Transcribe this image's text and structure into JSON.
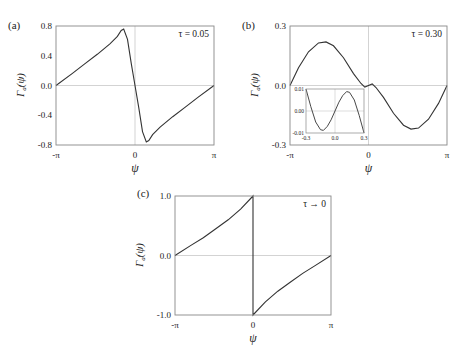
{
  "chart_data": [
    {
      "panel": "(a)",
      "type": "line",
      "annotation": "τ = 0.05",
      "xlabel": "ψ",
      "ylabel": "Γa(ψ)",
      "xlim": [
        -3.1416,
        3.1416
      ],
      "ylim": [
        -0.8,
        0.8
      ],
      "xticks": [
        "-π",
        "0",
        "π"
      ],
      "yticks": [
        "0.8",
        "0.4",
        "0.0",
        "-0.4",
        "-0.8"
      ],
      "grid": "zero lines only",
      "x": [
        -3.1416,
        -2.5,
        -2.0,
        -1.5,
        -1.0,
        -0.7,
        -0.55,
        -0.45,
        -0.3,
        -0.15,
        0.0,
        0.15,
        0.3,
        0.45,
        0.55,
        0.7,
        1.0,
        1.5,
        2.0,
        2.5,
        3.1416
      ],
      "values": [
        0.0,
        0.16,
        0.29,
        0.42,
        0.56,
        0.66,
        0.74,
        0.76,
        0.62,
        0.3,
        0.0,
        -0.3,
        -0.62,
        -0.76,
        -0.74,
        -0.66,
        -0.56,
        -0.42,
        -0.29,
        -0.16,
        0.0
      ]
    },
    {
      "panel": "(b)",
      "type": "line",
      "annotation": "τ = 0.30",
      "xlabel": "ψ",
      "ylabel": "Γa(ψ)",
      "xlim": [
        -3.1416,
        3.1416
      ],
      "ylim": [
        -0.3,
        0.3
      ],
      "xticks": [
        "-π",
        "0",
        "π"
      ],
      "yticks": [
        "0.3",
        "0.0",
        "-0.3"
      ],
      "grid": "zero lines only",
      "x": [
        -3.1416,
        -2.8,
        -2.4,
        -2.0,
        -1.7,
        -1.4,
        -1.0,
        -0.6,
        -0.3,
        -0.15,
        0.0,
        0.15,
        0.3,
        0.6,
        1.0,
        1.4,
        1.7,
        2.0,
        2.4,
        2.8,
        3.1416
      ],
      "values": [
        0.0,
        0.09,
        0.17,
        0.215,
        0.22,
        0.2,
        0.14,
        0.06,
        0.01,
        -0.008,
        0.0,
        0.008,
        -0.01,
        -0.06,
        -0.14,
        -0.2,
        -0.22,
        -0.215,
        -0.17,
        -0.09,
        0.0
      ],
      "inset": {
        "xlim": [
          -0.3,
          0.3
        ],
        "ylim": [
          -0.01,
          0.01
        ],
        "xticks": [
          "-0.3",
          "0.0",
          "0.3"
        ],
        "yticks": [
          "0.01",
          "0.00",
          "-0.01"
        ],
        "x": [
          -0.3,
          -0.25,
          -0.2,
          -0.15,
          -0.12,
          -0.08,
          -0.04,
          0.0,
          0.04,
          0.08,
          0.12,
          0.15,
          0.2,
          0.25,
          0.3
        ],
        "values": [
          0.01,
          0.002,
          -0.005,
          -0.0085,
          -0.0088,
          -0.007,
          -0.004,
          0.0,
          0.004,
          0.007,
          0.0088,
          0.0085,
          0.005,
          -0.002,
          -0.01
        ]
      }
    },
    {
      "panel": "(c)",
      "type": "line",
      "annotation": "τ → 0",
      "xlabel": "ψ",
      "ylabel": "Γa(ψ)",
      "xlim": [
        -3.1416,
        3.1416
      ],
      "ylim": [
        -1.0,
        1.0
      ],
      "xticks": [
        "-π",
        "0",
        "π"
      ],
      "yticks": [
        "1.0",
        "0.0",
        "-1.0"
      ],
      "grid": "zero lines only",
      "x": [
        -3.1416,
        -2.5,
        -2.0,
        -1.5,
        -1.0,
        -0.5,
        0.0,
        0.0,
        0.5,
        1.0,
        1.5,
        2.0,
        2.5,
        3.1416
      ],
      "values": [
        0.0,
        0.17,
        0.3,
        0.45,
        0.6,
        0.78,
        1.0,
        -1.0,
        -0.78,
        -0.6,
        -0.45,
        -0.3,
        -0.17,
        0.0
      ]
    }
  ],
  "panels": {
    "a": {
      "label": "(a)",
      "annotation": "τ = 0.05",
      "ylabel_main": "Γ",
      "ylabel_sub": "a",
      "ylabel_arg": "(ψ)",
      "xlabel": "ψ",
      "yticks": [
        "0.8",
        "0.4",
        "0.0",
        "-0.4",
        "-0.8"
      ],
      "xticks": [
        "-π",
        "0",
        "π"
      ]
    },
    "b": {
      "label": "(b)",
      "annotation": "τ = 0.30",
      "ylabel_main": "Γ",
      "ylabel_sub": "a",
      "ylabel_arg": "(ψ)",
      "xlabel": "ψ",
      "yticks": [
        "0.3",
        "0.0",
        "-0.3"
      ],
      "xticks": [
        "-π",
        "0",
        "π"
      ],
      "inset_yticks": [
        "0.01",
        "0.00",
        "-0.01"
      ],
      "inset_xticks": [
        "-0.3",
        "0.0",
        "0.3"
      ]
    },
    "c": {
      "label": "(c)",
      "annotation": "τ → 0",
      "ylabel_main": "Γ",
      "ylabel_sub": "a",
      "ylabel_arg": "(ψ)",
      "xlabel": "ψ",
      "yticks": [
        "1.0",
        "0.0",
        "-1.0"
      ],
      "xticks": [
        "-π",
        "0",
        "π"
      ]
    }
  }
}
